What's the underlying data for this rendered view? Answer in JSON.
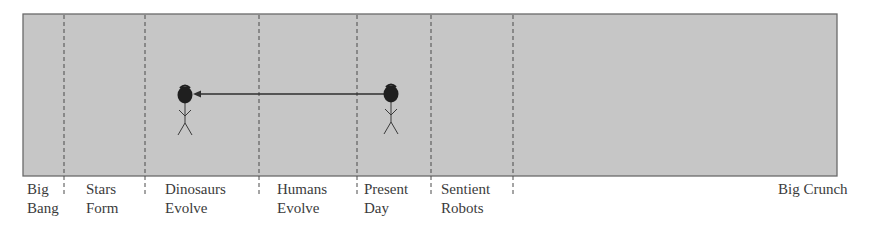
{
  "diagram": {
    "box": {
      "x": 23,
      "y": 14,
      "width": 814,
      "height": 162,
      "fill": "#c6c6c6",
      "stroke": "#6a6a6a"
    },
    "dividers": [
      64,
      145,
      259,
      357,
      431,
      513
    ],
    "divider_color": "#4a4a4a",
    "eras": [
      {
        "id": "big-bang",
        "line1": "Big",
        "line2": "Bang",
        "x": 27
      },
      {
        "id": "stars-form",
        "line1": "Stars",
        "line2": "Form",
        "x": 86
      },
      {
        "id": "dinosaurs-evolve",
        "line1": "Dinosaurs",
        "line2": "Evolve",
        "x": 165
      },
      {
        "id": "humans-evolve",
        "line1": "Humans",
        "line2": "Evolve",
        "x": 277
      },
      {
        "id": "present-day",
        "line1": "Present",
        "line2": "Day",
        "x": 364
      },
      {
        "id": "sentient-robots",
        "line1": "Sentient",
        "line2": "Robots",
        "x": 441
      },
      {
        "id": "big-crunch",
        "line1": "Big Crunch",
        "line2": "",
        "x": 778
      }
    ],
    "figures": [
      {
        "id": "traveler-past",
        "cx": 185,
        "head_y": 95,
        "era": "Dinosaurs Evolve"
      },
      {
        "id": "traveler-present",
        "cx": 391,
        "head_y": 94,
        "era": "Present Day"
      }
    ],
    "arrow": {
      "from_x": 384,
      "to_x": 194,
      "y": 94,
      "direction": "backward-in-time"
    }
  }
}
